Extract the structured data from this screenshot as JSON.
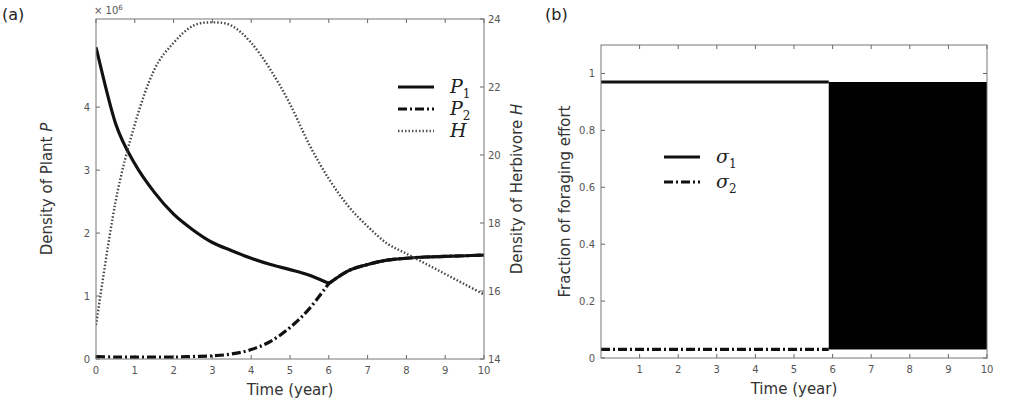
{
  "chart_data": [
    {
      "id": "a",
      "type": "line",
      "panel_label": "(a)",
      "title": "",
      "xlabel": "Time (year)",
      "ylabel": "Density of Plant P",
      "ylabel_right": "Density of Herbivore H",
      "y_multiplier_label": "× 10^6",
      "xlim": [
        0,
        10
      ],
      "ylim": [
        0,
        5.4
      ],
      "ylim_right": [
        14,
        24
      ],
      "xticks": [
        "0",
        "1",
        "2",
        "3",
        "4",
        "5",
        "6",
        "7",
        "8",
        "9",
        "10"
      ],
      "yticks": [
        "0",
        "1",
        "2",
        "3",
        "4"
      ],
      "yticks_right": [
        "14",
        "16",
        "18",
        "20",
        "22",
        "24"
      ],
      "grid": false,
      "legend_position": "upper right",
      "x": [
        0,
        0.5,
        1,
        1.5,
        2,
        2.5,
        3,
        3.5,
        4,
        4.5,
        5,
        5.5,
        6,
        6.5,
        7,
        7.5,
        8,
        8.5,
        9,
        9.5,
        10
      ],
      "series": [
        {
          "name": "P1",
          "axis": "left",
          "style": "solid",
          "values": [
            4.95,
            3.75,
            3.1,
            2.65,
            2.3,
            2.05,
            1.85,
            1.72,
            1.6,
            1.5,
            1.42,
            1.33,
            1.2,
            1.4,
            1.5,
            1.57,
            1.6,
            1.62,
            1.63,
            1.64,
            1.65
          ]
        },
        {
          "name": "P2",
          "axis": "left",
          "style": "dashdot",
          "values": [
            0.04,
            0.03,
            0.03,
            0.03,
            0.03,
            0.04,
            0.05,
            0.08,
            0.15,
            0.28,
            0.5,
            0.8,
            1.2,
            1.4,
            1.5,
            1.57,
            1.6,
            1.62,
            1.63,
            1.64,
            1.65
          ]
        },
        {
          "name": "H",
          "axis": "right",
          "style": "dotted",
          "values": [
            15.0,
            18.6,
            20.9,
            22.5,
            23.3,
            23.8,
            23.9,
            23.8,
            23.3,
            22.5,
            21.5,
            20.3,
            19.3,
            18.5,
            17.9,
            17.4,
            17.1,
            16.8,
            16.5,
            16.2,
            15.9
          ]
        }
      ],
      "legend": [
        {
          "label": "P",
          "sub": "1",
          "style": "solid"
        },
        {
          "label": "P",
          "sub": "2",
          "style": "dashdot"
        },
        {
          "label": "H",
          "sub": "",
          "style": "dotted"
        }
      ]
    },
    {
      "id": "b",
      "type": "line",
      "panel_label": "(b)",
      "title": "",
      "xlabel": "Time (year)",
      "ylabel": "Fraction of foraging effort",
      "xlim": [
        0,
        10
      ],
      "ylim": [
        0,
        1.1
      ],
      "xticks": [
        "1",
        "2",
        "3",
        "4",
        "5",
        "6",
        "7",
        "8",
        "9",
        "10"
      ],
      "yticks": [
        "0",
        "0.2",
        "0.4",
        "0.6",
        "0.8",
        "1"
      ],
      "grid": false,
      "legend_position": "center left",
      "series": [
        {
          "name": "sigma1",
          "style": "solid",
          "x": [
            0,
            5.9
          ],
          "values": [
            0.97,
            0.97
          ],
          "note": "after t≈5.9 rapidly oscillates between ~0.03 and ~0.97 (filled black region) until t=10"
        },
        {
          "name": "sigma2",
          "style": "dashdot",
          "x": [
            0,
            5.9
          ],
          "values": [
            0.03,
            0.03
          ],
          "note": "after t≈5.9 rapidly oscillates between ~0.03 and ~0.97 (filled black region) until t=10"
        }
      ],
      "oscillation_region": {
        "x_start": 5.9,
        "x_end": 10,
        "y_low": 0.03,
        "y_high": 0.97
      },
      "legend": [
        {
          "label": "σ",
          "sub": "1",
          "style": "solid"
        },
        {
          "label": "σ",
          "sub": "2",
          "style": "dashdot"
        }
      ]
    }
  ]
}
